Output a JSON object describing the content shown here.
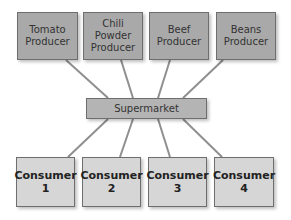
{
  "colors": {
    "producer_fill": "#a9a9a9",
    "hub_fill": "#b4b4b4",
    "consumer_fill": "#d6d6d6",
    "line": "#8f8f8f"
  },
  "producers": [
    {
      "label": "Tomato\nProducer"
    },
    {
      "label": "Chili\nPowder\nProducer"
    },
    {
      "label": "Beef\nProducer"
    },
    {
      "label": "Beans\nProducer"
    }
  ],
  "hub": {
    "label": "Supermarket"
  },
  "consumers": [
    {
      "label": "Consumer\n1"
    },
    {
      "label": "Consumer\n2"
    },
    {
      "label": "Consumer\n3"
    },
    {
      "label": "Consumer\n4"
    }
  ]
}
